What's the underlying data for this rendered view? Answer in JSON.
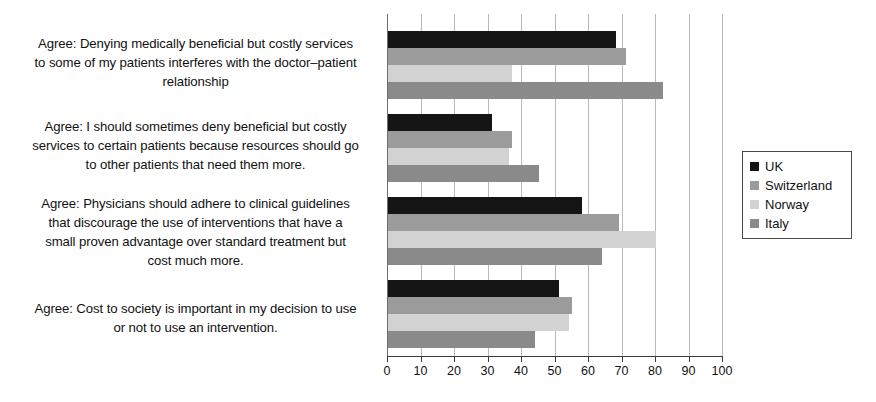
{
  "chart_data": {
    "type": "bar",
    "orientation": "horizontal",
    "title": "",
    "subtitle": "",
    "xlabel": "",
    "ylabel": "",
    "xlim": [
      0,
      100
    ],
    "xticks": [
      0,
      10,
      20,
      30,
      40,
      50,
      60,
      70,
      80,
      90,
      100
    ],
    "xtick_labels": [
      "0",
      "10",
      "20",
      "30",
      "40",
      "50",
      "60",
      "70",
      "80",
      "90",
      "100"
    ],
    "grid": "vertical",
    "legend_position": "right",
    "categories": [
      "Agree: Denying medically beneficial but costly services to some of my patients interferes with the doctor–patient relationship",
      "Agree: I should sometimes deny beneficial but costly services to certain patients because resources should go to other patients that need them more.",
      "Agree: Physicians should adhere to clinical guidelines that discourage the use of interventions that have a small proven advantage over standard treatment but cost much more.",
      "Agree: Cost to society is important in my decision to use or not to use an intervention."
    ],
    "category_lines": [
      [
        "Agree: Denying medically beneficial but costly services",
        "to some of my patients interferes with the doctor–patient",
        "relationship"
      ],
      [
        "Agree: I should sometimes deny beneficial but costly",
        "services to certain patients because resources should go",
        "to other patients that need them more."
      ],
      [
        "Agree: Physicians should adhere to clinical guidelines",
        "that discourage the use of interventions that have a",
        "small proven advantage over standard treatment but",
        "cost much more."
      ],
      [
        "Agree: Cost to society is important in my decision to use",
        "or not to use an intervention."
      ]
    ],
    "series": [
      {
        "name": "UK",
        "color": "#151515",
        "values": [
          68,
          31,
          58,
          51
        ]
      },
      {
        "name": "Switzerland",
        "color": "#9b9b9b",
        "values": [
          71,
          37,
          69,
          55
        ]
      },
      {
        "name": "Norway",
        "color": "#d2d2d2",
        "values": [
          37,
          36,
          80,
          54
        ]
      },
      {
        "name": "Italy",
        "color": "#8a8a8a",
        "values": [
          82,
          45,
          64,
          44
        ]
      }
    ]
  },
  "legend": {
    "items": [
      {
        "label": "UK",
        "color": "#151515"
      },
      {
        "label": "Switzerland",
        "color": "#9b9b9b"
      },
      {
        "label": "Norway",
        "color": "#d2d2d2"
      },
      {
        "label": "Italy",
        "color": "#8a8a8a"
      }
    ]
  }
}
